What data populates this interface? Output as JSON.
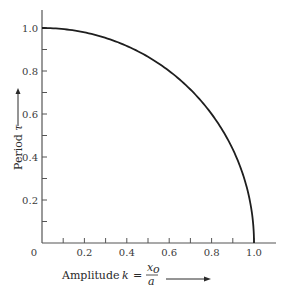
{
  "chart_data": {
    "type": "line",
    "title": "",
    "xlabel": "Amplitude  k = x_o / a",
    "ylabel": "Period τ",
    "xlabel_parts": {
      "text": "Amplitude",
      "var": "k",
      "eq": "=",
      "num": "x",
      "num_sub": "o",
      "den": "a"
    },
    "ylabel_parts": {
      "text": "Period",
      "var": "τ"
    },
    "xlim": [
      0,
      1.0
    ],
    "ylim": [
      0,
      1.0
    ],
    "x_ticks": [
      "0",
      "0.2",
      "0.4",
      "0.6",
      "0.8",
      "1.0"
    ],
    "y_ticks": [
      "0.2",
      "0.4",
      "0.6",
      "0.8",
      "1.0"
    ],
    "grid": false,
    "series": [
      {
        "name": "period vs amplitude",
        "x": [
          0,
          0.1,
          0.2,
          0.3,
          0.4,
          0.5,
          0.6,
          0.7,
          0.8,
          0.9,
          0.95,
          0.99,
          1.0
        ],
        "y": [
          1.0,
          0.995,
          0.98,
          0.954,
          0.917,
          0.866,
          0.8,
          0.714,
          0.6,
          0.436,
          0.312,
          0.141,
          0.0
        ]
      }
    ]
  }
}
